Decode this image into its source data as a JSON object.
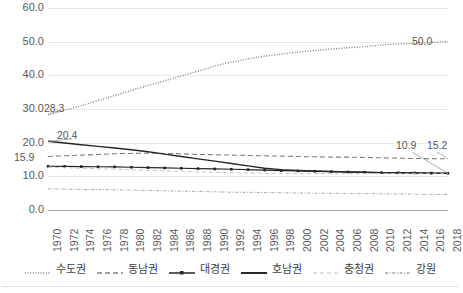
{
  "chart_data": {
    "type": "line",
    "title": "",
    "xlabel": "",
    "ylabel": "",
    "ylim": [
      0,
      60
    ],
    "yticks": [
      "0.0",
      "10.0",
      "20.0",
      "30.0",
      "40.0",
      "50.0",
      "60.0"
    ],
    "ytick_values": [
      0,
      10,
      20,
      30,
      40,
      50,
      60
    ],
    "grid": true,
    "legend_position": "bottom",
    "categories": [
      "1970",
      "1972",
      "1974",
      "1976",
      "1978",
      "1980",
      "1982",
      "1984",
      "1986",
      "1988",
      "1990",
      "1992",
      "1994",
      "1996",
      "1998",
      "2000",
      "2002",
      "2004",
      "2006",
      "2008",
      "2010",
      "2012",
      "2014",
      "2016",
      "2018"
    ],
    "series": [
      {
        "name": "수도권",
        "style": "dotted",
        "color": "#808080",
        "values": [
          28.3,
          29.6,
          31.0,
          32.5,
          34.0,
          35.5,
          37.0,
          38.4,
          39.8,
          41.2,
          42.8,
          43.9,
          44.9,
          45.7,
          46.3,
          46.9,
          47.4,
          47.8,
          48.2,
          48.5,
          49.0,
          49.3,
          49.5,
          49.8,
          50.0
        ]
      },
      {
        "name": "동남권",
        "style": "dashed",
        "color": "#808080",
        "values": [
          15.9,
          16.1,
          16.3,
          16.5,
          16.7,
          16.8,
          16.9,
          16.8,
          16.7,
          16.5,
          16.4,
          16.3,
          16.2,
          16.1,
          16.0,
          15.9,
          15.8,
          15.7,
          15.7,
          15.6,
          15.5,
          15.4,
          15.3,
          15.25,
          15.2
        ]
      },
      {
        "name": "대경권",
        "style": "line-marker",
        "color": "#262626",
        "values": [
          13.0,
          12.95,
          12.9,
          12.85,
          12.8,
          12.7,
          12.6,
          12.5,
          12.4,
          12.3,
          12.2,
          12.1,
          12.0,
          11.85,
          11.7,
          11.6,
          11.5,
          11.4,
          11.3,
          11.2,
          11.1,
          11.05,
          11.0,
          10.95,
          10.9
        ]
      },
      {
        "name": "호남권",
        "style": "solid",
        "color": "#262626",
        "values": [
          20.4,
          19.9,
          19.4,
          18.9,
          18.4,
          17.9,
          17.3,
          16.6,
          15.9,
          15.2,
          14.5,
          13.8,
          13.1,
          12.4,
          12.0,
          11.75,
          11.6,
          11.45,
          11.3,
          11.2,
          11.1,
          11.05,
          11.0,
          10.95,
          10.9
        ]
      },
      {
        "name": "충청권",
        "style": "light-dashed",
        "color": "#bfbfbf",
        "values": [
          12.7,
          12.55,
          12.4,
          12.25,
          12.1,
          11.95,
          11.8,
          11.65,
          11.5,
          11.35,
          11.2,
          11.1,
          11.0,
          10.9,
          10.85,
          10.8,
          10.8,
          10.8,
          10.8,
          10.8,
          10.8,
          10.85,
          10.85,
          10.9,
          10.9
        ]
      },
      {
        "name": "강원",
        "style": "dash-dot",
        "color": "#a6a6a6",
        "values": [
          6.3,
          6.2,
          6.1,
          6.05,
          6.0,
          5.9,
          5.8,
          5.7,
          5.6,
          5.5,
          5.4,
          5.3,
          5.25,
          5.2,
          5.1,
          5.05,
          5.0,
          4.95,
          4.9,
          4.85,
          4.8,
          4.75,
          4.7,
          4.65,
          4.6
        ]
      }
    ],
    "annotations": [
      {
        "text": "28.3",
        "series": "수도권",
        "position": "start"
      },
      {
        "text": "50.0",
        "series": "수도권",
        "position": "end"
      },
      {
        "text": "20.4",
        "series": "호남권",
        "position": "start"
      },
      {
        "text": "15.9",
        "series": "동남권",
        "position": "start"
      },
      {
        "text": "15.2",
        "series": "동남권",
        "position": "end"
      },
      {
        "text": "10.9",
        "series": "대경권",
        "position": "end"
      }
    ]
  },
  "legend": {
    "items": [
      {
        "label": "수도권",
        "style": "dotted"
      },
      {
        "label": "동남권",
        "style": "dashed"
      },
      {
        "label": "대경권",
        "style": "line-marker"
      },
      {
        "label": "호남권",
        "style": "solid"
      },
      {
        "label": "충청권",
        "style": "light-dashed"
      },
      {
        "label": "강원",
        "style": "dash-dot"
      }
    ]
  }
}
